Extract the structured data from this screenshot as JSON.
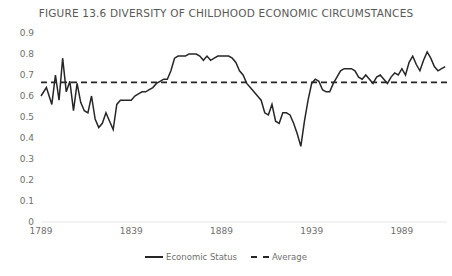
{
  "chart_data": {
    "type": "line",
    "title": "FIGURE 13.6  DIVERSITY OF CHILDHOOD ECONOMIC CIRCUMSTANCES",
    "xlabel": "",
    "ylabel": "",
    "xlim": [
      1789,
      2014
    ],
    "ylim": [
      0,
      0.9
    ],
    "yticks": [
      "0",
      "0.1",
      "0.2",
      "0.3",
      "0.4",
      "0.5",
      "0.6",
      "0.7",
      "0.8",
      "0.9"
    ],
    "ytick_values": [
      0,
      0.1,
      0.2,
      0.3,
      0.4,
      0.5,
      0.6,
      0.7,
      0.8,
      0.9
    ],
    "xticks": [
      "1789",
      "1839",
      "1889",
      "1939",
      "1989"
    ],
    "xtick_values": [
      1789,
      1839,
      1889,
      1939,
      1989
    ],
    "grid": false,
    "legend_position": "bottom",
    "series": [
      {
        "name": "Economic Status",
        "style": "solid",
        "color": "#262626",
        "x": [
          1789,
          1792,
          1795,
          1797,
          1799,
          1801,
          1803,
          1805,
          1807,
          1809,
          1811,
          1813,
          1815,
          1817,
          1819,
          1821,
          1823,
          1825,
          1827,
          1829,
          1831,
          1833,
          1835,
          1837,
          1839,
          1841,
          1843,
          1845,
          1847,
          1849,
          1851,
          1853,
          1855,
          1857,
          1859,
          1861,
          1863,
          1865,
          1867,
          1869,
          1871,
          1873,
          1875,
          1877,
          1879,
          1881,
          1883,
          1885,
          1887,
          1889,
          1891,
          1893,
          1895,
          1897,
          1899,
          1901,
          1903,
          1905,
          1907,
          1909,
          1911,
          1913,
          1915,
          1917,
          1919,
          1921,
          1923,
          1925,
          1927,
          1929,
          1931,
          1933,
          1935,
          1937,
          1939,
          1941,
          1943,
          1945,
          1947,
          1949,
          1951,
          1953,
          1955,
          1957,
          1959,
          1961,
          1963,
          1965,
          1967,
          1969,
          1971,
          1973,
          1975,
          1977,
          1979,
          1981,
          1983,
          1985,
          1987,
          1989,
          1991,
          1993,
          1995,
          1997,
          1999,
          2001,
          2003,
          2005,
          2007,
          2009,
          2011,
          2013
        ],
        "values": [
          0.6,
          0.64,
          0.56,
          0.7,
          0.58,
          0.78,
          0.62,
          0.67,
          0.53,
          0.66,
          0.57,
          0.53,
          0.52,
          0.6,
          0.49,
          0.45,
          0.47,
          0.52,
          0.48,
          0.44,
          0.56,
          0.58,
          0.58,
          0.58,
          0.58,
          0.6,
          0.61,
          0.62,
          0.62,
          0.63,
          0.64,
          0.66,
          0.67,
          0.68,
          0.68,
          0.72,
          0.78,
          0.79,
          0.79,
          0.79,
          0.8,
          0.8,
          0.8,
          0.79,
          0.77,
          0.79,
          0.77,
          0.78,
          0.79,
          0.79,
          0.79,
          0.79,
          0.78,
          0.76,
          0.72,
          0.7,
          0.66,
          0.64,
          0.62,
          0.6,
          0.58,
          0.52,
          0.51,
          0.56,
          0.48,
          0.47,
          0.52,
          0.52,
          0.51,
          0.47,
          0.42,
          0.36,
          0.48,
          0.58,
          0.66,
          0.68,
          0.67,
          0.63,
          0.62,
          0.62,
          0.66,
          0.69,
          0.72,
          0.73,
          0.73,
          0.73,
          0.72,
          0.69,
          0.68,
          0.7,
          0.68,
          0.66,
          0.69,
          0.7,
          0.68,
          0.66,
          0.69,
          0.71,
          0.7,
          0.73,
          0.7,
          0.76,
          0.79,
          0.75,
          0.72,
          0.77,
          0.81,
          0.78,
          0.74,
          0.72,
          0.73,
          0.74
        ]
      },
      {
        "name": "Average",
        "style": "dashed",
        "color": "#262626",
        "constant_value": 0.665
      }
    ]
  },
  "legend": {
    "items": [
      {
        "label": "Economic Status",
        "swatch": "solid-line-swatch"
      },
      {
        "label": "Average",
        "swatch": "dashed-line-swatch"
      }
    ]
  }
}
